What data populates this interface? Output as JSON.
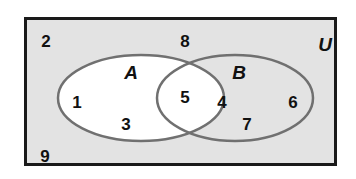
{
  "diagram": {
    "type": "venn",
    "universe_label": "U",
    "sets": [
      {
        "name": "A",
        "label": "A",
        "elements_only": [
          "1",
          "3"
        ]
      },
      {
        "name": "B",
        "label": "B",
        "elements_only": [
          "4",
          "6",
          "7"
        ]
      }
    ],
    "intersection": [
      "5"
    ],
    "outside": [
      "2",
      "8",
      "9"
    ],
    "colors": {
      "universe_fill": "#e3e3e3",
      "universe_border": "#1a1a1a",
      "set_a_fill": "#ffffff",
      "circle_stroke": "#707070",
      "text": "#111111"
    }
  },
  "labels": {
    "u": "U",
    "a": "A",
    "b": "B",
    "n1": "1",
    "n2": "2",
    "n3": "3",
    "n4": "4",
    "n5": "5",
    "n6": "6",
    "n7": "7",
    "n8": "8",
    "n9": "9"
  }
}
